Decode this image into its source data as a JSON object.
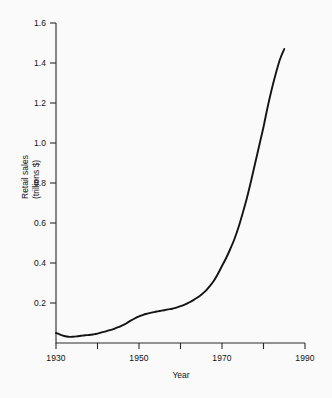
{
  "figure": {
    "background_color": "#fbfafa",
    "line_color": "#141414",
    "axis_color": "#2a2a2a"
  },
  "axes": {
    "x_title": "Year",
    "y_title_line1": "Retail sales",
    "y_title_line2": "(trillions $)",
    "x_major_ticks": [
      "1930",
      "1950",
      "1970",
      "1990"
    ],
    "x_minor_ticks": [
      "1940",
      "1960",
      "1980"
    ],
    "y_ticks": [
      "1.6",
      "1.4",
      "1.2",
      "1.0",
      "0.8",
      "0.6",
      "0.4",
      "0.2"
    ]
  },
  "chart_data": {
    "type": "line",
    "title": "",
    "xlabel": "Year",
    "ylabel": "Retail sales (trillions $)",
    "xlim": [
      1930,
      1990
    ],
    "ylim": [
      0.0,
      1.6
    ],
    "xticks": [
      1930,
      1940,
      1950,
      1960,
      1970,
      1980,
      1990
    ],
    "xticklabels": [
      "1930",
      "",
      "1950",
      "",
      "1970",
      "",
      "1990"
    ],
    "yticks": [
      0.2,
      0.4,
      0.6,
      0.8,
      1.0,
      1.2,
      1.4,
      1.6
    ],
    "yticklabels": [
      "0.2",
      "0.4",
      "0.6",
      "0.8",
      "1.0",
      "1.2",
      "1.4",
      "1.6"
    ],
    "grid": false,
    "legend": null,
    "series": [
      {
        "name": "Retail sales",
        "x": [
          1930,
          1931,
          1932,
          1933,
          1934,
          1935,
          1936,
          1937,
          1938,
          1939,
          1940,
          1941,
          1942,
          1943,
          1944,
          1945,
          1946,
          1947,
          1948,
          1949,
          1950,
          1951,
          1952,
          1953,
          1954,
          1955,
          1956,
          1957,
          1958,
          1959,
          1960,
          1961,
          1962,
          1963,
          1964,
          1965,
          1966,
          1967,
          1968,
          1969,
          1970,
          1971,
          1972,
          1973,
          1974,
          1975,
          1976,
          1977,
          1978,
          1979,
          1980,
          1981,
          1982,
          1983,
          1984,
          1985
        ],
        "y": [
          0.05,
          0.042,
          0.035,
          0.031,
          0.031,
          0.033,
          0.036,
          0.039,
          0.04,
          0.043,
          0.047,
          0.053,
          0.058,
          0.064,
          0.071,
          0.079,
          0.088,
          0.099,
          0.112,
          0.123,
          0.133,
          0.141,
          0.147,
          0.152,
          0.156,
          0.16,
          0.164,
          0.168,
          0.171,
          0.177,
          0.184,
          0.192,
          0.202,
          0.213,
          0.226,
          0.241,
          0.259,
          0.283,
          0.31,
          0.345,
          0.385,
          0.425,
          0.47,
          0.52,
          0.58,
          0.65,
          0.725,
          0.81,
          0.9,
          0.99,
          1.08,
          1.18,
          1.27,
          1.35,
          1.42,
          1.47
        ]
      }
    ],
    "annotations": [
      {
        "text": "minimum near 1933-1934",
        "value": 0.031
      },
      {
        "text": "plateau near 1955-1958",
        "value": 0.165
      },
      {
        "text": "final value 1985",
        "value": 1.47
      }
    ]
  }
}
